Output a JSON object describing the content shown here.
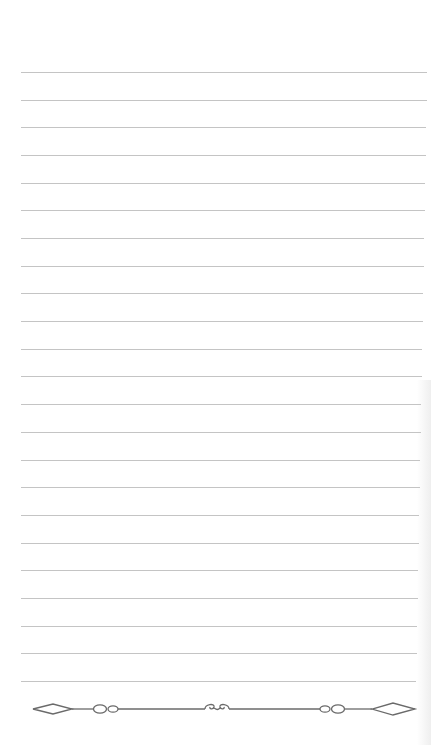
{
  "page": {
    "type": "lined-notebook-page",
    "background": "#ffffff",
    "line_color": "#c4c4c4",
    "ornament_color": "#6a6a6a"
  },
  "lines": {
    "count": 23,
    "first_y": 72,
    "spacing": 27.68,
    "left_x": 21,
    "right_x_top": 427,
    "right_x_bottom": 416
  },
  "divider": {
    "y": 709,
    "elements": [
      "left-diamond",
      "left-double-circle",
      "center-swirl",
      "right-double-circle",
      "right-diamond"
    ]
  }
}
